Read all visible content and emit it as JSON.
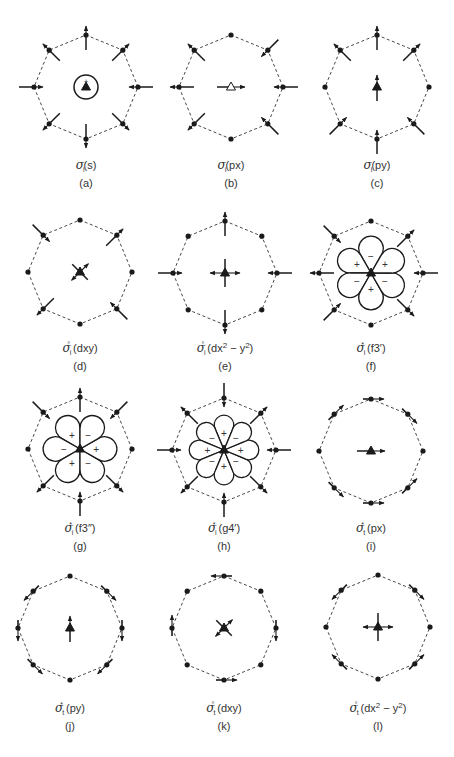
{
  "figure": {
    "radius": 52,
    "colors": {
      "line": "#1a1a1a",
      "dashed": "#333333",
      "text": "#333333"
    },
    "panels": [
      {
        "id": "a",
        "tag": "(a)",
        "cx": 86,
        "cy": 87,
        "sym": "σ",
        "sub": "i",
        "sup": "",
        "label": "(s)",
        "center": {
          "kind": "circle-plus",
          "arrows": []
        },
        "vertex_motion": "radial-in-out",
        "sign_label": "+"
      },
      {
        "id": "b",
        "tag": "(b)",
        "cx": 231,
        "cy": 87,
        "sym": "σ",
        "sub": "i",
        "sup": "",
        "label": "(px)",
        "center": {
          "kind": "h-arrows",
          "open": true
        },
        "vertex_motion": "radial-px"
      },
      {
        "id": "c",
        "tag": "(c)",
        "cx": 377,
        "cy": 87,
        "sym": "σ",
        "sub": "i",
        "sup": "",
        "label": "(py)",
        "center": {
          "kind": "v-arrows"
        },
        "vertex_motion": "radial-py"
      },
      {
        "id": "d",
        "tag": "(d)",
        "cx": 80,
        "cy": 272,
        "sym": "σ",
        "sub": "i",
        "sup": "°",
        "label": "(dxy)",
        "center": {
          "kind": "x-arrows"
        },
        "vertex_motion": "radial-dxy"
      },
      {
        "id": "e",
        "tag": "(e)",
        "cx": 225,
        "cy": 273,
        "sym": "σ",
        "sub": "i",
        "sup": "°",
        "label": "(dx",
        "label_sup": "2",
        "label_tail": " − y",
        "label_sup2": "2",
        "label_end": ")",
        "center": {
          "kind": "plus-arrows"
        },
        "vertex_motion": "radial-dx2y2"
      },
      {
        "id": "f",
        "tag": "(f)",
        "cx": 371,
        "cy": 273,
        "sym": "σ",
        "sub": "i",
        "sup": "*",
        "label": "(f3′)",
        "center": {
          "kind": "lobes",
          "count": 6,
          "offset_deg": 0,
          "signs": [
            "−",
            "+",
            "−",
            "+",
            "−",
            "+"
          ]
        },
        "vertex_motion": "radial-f3a"
      },
      {
        "id": "g",
        "tag": "(g)",
        "cx": 80,
        "cy": 449,
        "sym": "σ",
        "sub": "i",
        "sup": "*",
        "label": "(f3″)",
        "center": {
          "kind": "lobes",
          "count": 6,
          "offset_deg": 30,
          "signs": [
            "+",
            "−",
            "+",
            "−",
            "+",
            "−"
          ]
        },
        "vertex_motion": "radial-f3b"
      },
      {
        "id": "h",
        "tag": "(h)",
        "cx": 224,
        "cy": 450,
        "sym": "σ",
        "sub": "i",
        "sup": "*",
        "label": "(g4′)",
        "center": {
          "kind": "lobes",
          "count": 8,
          "offset_deg": 0,
          "signs": [
            "+",
            "−",
            "+",
            "−",
            "+",
            "−",
            "+",
            "−"
          ]
        },
        "vertex_motion": "radial-g4"
      },
      {
        "id": "i",
        "tag": "(i)",
        "cx": 371,
        "cy": 451,
        "sym": "σ",
        "sub": "t",
        "sup": "*",
        "label": "(px)",
        "center": {
          "kind": "h-arrows",
          "open": false
        },
        "vertex_motion": "tangential-px"
      },
      {
        "id": "j",
        "tag": "(j)",
        "cx": 70,
        "cy": 628,
        "sym": "σ",
        "sub": "t",
        "sup": "*",
        "label": "(py)",
        "center": {
          "kind": "v-arrows"
        },
        "vertex_motion": "tangential-py"
      },
      {
        "id": "k",
        "tag": "(k)",
        "cx": 224,
        "cy": 628,
        "sym": "σ",
        "sub": "t",
        "sup": "°",
        "label": "(dxy)",
        "center": {
          "kind": "x-arrows"
        },
        "vertex_motion": "tangential-dxy"
      },
      {
        "id": "l",
        "tag": "(l)",
        "cx": 378,
        "cy": 627,
        "sym": "σ",
        "sub": "t",
        "sup": "°",
        "label": "(dx",
        "label_sup": "2",
        "label_tail": " − y",
        "label_sup2": "2",
        "label_end": ")",
        "center": {
          "kind": "plus-arrows"
        },
        "vertex_motion": "tangential-dx2y2"
      }
    ]
  }
}
